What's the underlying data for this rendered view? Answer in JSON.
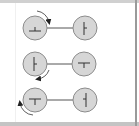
{
  "diagram": {
    "title": "",
    "colors": {
      "background": "#ffffff",
      "frame": "#b8b8b8",
      "circle_fill": "#d6d6d6",
      "circle_stroke": "#8c8c8c",
      "connector": "#555555",
      "symbol": "#333333",
      "arrow": "#222222"
    },
    "rows": [
      {
        "left": {
          "symbol": "up-tack",
          "glyph": "⊥"
        },
        "right": {
          "symbol": "vertical-bar-tick-right",
          "glyph": "⊢"
        },
        "rotation": {
          "direction": "clockwise",
          "position": "top-right"
        }
      },
      {
        "left": {
          "symbol": "vertical-bar-tick-right",
          "glyph": "⊢"
        },
        "right": {
          "symbol": "down-tack",
          "glyph": "⊤"
        },
        "rotation": {
          "direction": "clockwise",
          "position": "bottom-right"
        }
      },
      {
        "left": {
          "symbol": "down-tack",
          "glyph": "⊤"
        },
        "right": {
          "symbol": "vertical-bar-tick-left",
          "glyph": "⊣"
        },
        "rotation": {
          "direction": "clockwise",
          "position": "left"
        }
      }
    ]
  }
}
